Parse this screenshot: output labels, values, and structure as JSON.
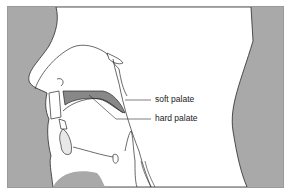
{
  "diagram": {
    "type": "sagittal cross-section of human head",
    "colors": {
      "background_gray": "#a9a9a9",
      "outline": "#2a2a2a",
      "palate_fill": "#888888",
      "head_fill": "#ffffff"
    },
    "labels": {
      "soft_palate": "soft palate",
      "hard_palate": "hard palate"
    }
  }
}
